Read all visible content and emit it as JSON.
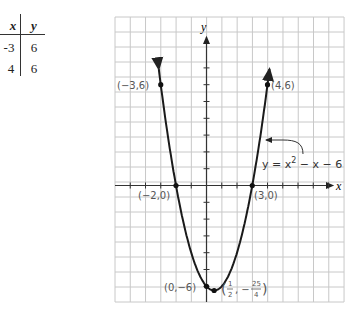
{
  "table": {
    "headers": [
      "x",
      "y"
    ],
    "rows": [
      [
        "-3",
        "6"
      ],
      [
        "4",
        "6"
      ]
    ]
  },
  "chart_data": {
    "type": "line",
    "title": "",
    "equation": "y = x² − x − 6",
    "equation_parts": {
      "lhs": "y = x",
      "exp": "2",
      "rhs": " − x − 6"
    },
    "xlabel": "x",
    "ylabel": "y",
    "grid": true,
    "x_range": [
      -6,
      9
    ],
    "y_range": [
      -7,
      10
    ],
    "points": [
      {
        "x": -3,
        "y": 6,
        "label": "(−3,6)"
      },
      {
        "x": 4,
        "y": 6,
        "label": "(4,6)"
      },
      {
        "x": -2,
        "y": 0,
        "label": "(−2,0)"
      },
      {
        "x": 3,
        "y": 0,
        "label": "(3,0)"
      },
      {
        "x": 0,
        "y": -6,
        "label": "(0,−6)"
      },
      {
        "x": 0.5,
        "y": -6.25,
        "label": "(1/2, −25/4)"
      }
    ],
    "vertex_label": {
      "num1": "1",
      "den1": "2",
      "num2": "25",
      "den2": "4"
    }
  }
}
